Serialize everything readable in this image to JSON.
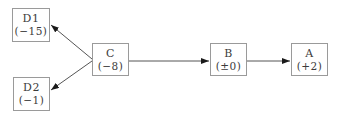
{
  "diagram": {
    "nodes": [
      {
        "id": "D1",
        "label": "D1",
        "value": "(−15)"
      },
      {
        "id": "D2",
        "label": "D2",
        "value": "(−1)"
      },
      {
        "id": "C",
        "label": "C",
        "value": "(−8)"
      },
      {
        "id": "B",
        "label": "B",
        "value": "(±0)"
      },
      {
        "id": "A",
        "label": "A",
        "value": "(+2)"
      }
    ],
    "edges": [
      {
        "from": "C",
        "to": "D1"
      },
      {
        "from": "C",
        "to": "D2"
      },
      {
        "from": "C",
        "to": "B"
      },
      {
        "from": "B",
        "to": "A"
      }
    ],
    "colors": {
      "box_border": "#9a9a9a",
      "box_fill": "#ffffff",
      "text": "#3c3c3c",
      "edge_line": "#555555",
      "arrowhead": "#1a1a1a"
    }
  }
}
